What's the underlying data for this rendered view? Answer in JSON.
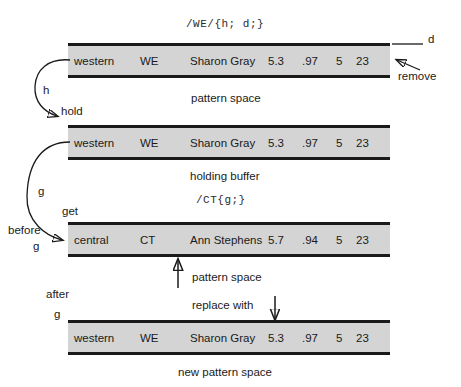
{
  "diagram": {
    "title_code_top": "/WE/{h; d;}",
    "title_code_mid": "/CT{g;}",
    "columns": [
      "region",
      "code",
      "name",
      "n1",
      "n2",
      "n3",
      "n4"
    ],
    "rows": [
      {
        "id": "pattern-space-initial",
        "region": "western",
        "code": "WE",
        "name": "Sharon Gray",
        "n1": "5.3",
        "n2": ".97",
        "n3": "5",
        "n4": "23",
        "caption": "pattern space"
      },
      {
        "id": "holding-buffer",
        "region": "western",
        "code": "WE",
        "name": "Sharon Gray",
        "n1": "5.3",
        "n2": ".97",
        "n3": "5",
        "n4": "23",
        "caption": "holding buffer"
      },
      {
        "id": "pattern-space-before-g",
        "region": "central",
        "code": "CT",
        "name": "Ann Stephens",
        "n1": "5.7",
        "n2": ".94",
        "n3": "5",
        "n4": "23",
        "caption": "pattern space"
      },
      {
        "id": "new-pattern-space",
        "region": "western",
        "code": "WE",
        "name": "Sharon Gray",
        "n1": "5.3",
        "n2": ".97",
        "n3": "5",
        "n4": "23",
        "caption": "new pattern space"
      }
    ],
    "annotations": {
      "d": "d",
      "remove": "remove",
      "h": "h",
      "hold": "hold",
      "g": "g",
      "get": "get",
      "before": "before",
      "before_g": "g",
      "after": "after",
      "after_g": "g",
      "replace_with": "replace with"
    },
    "colors": {
      "bar_fill": "#d4d4d4",
      "bar_border": "#1a1a1a",
      "text": "#1a1a1a",
      "background": "#ffffff"
    }
  }
}
